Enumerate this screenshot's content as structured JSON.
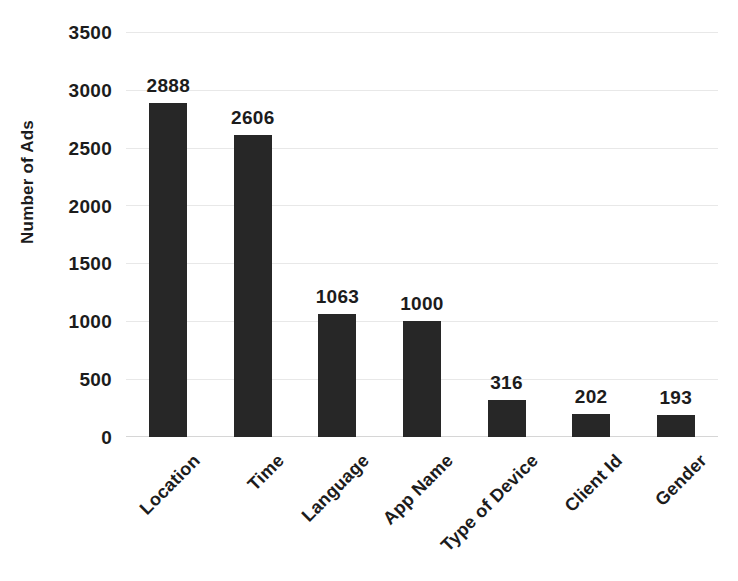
{
  "chart_data": {
    "type": "bar",
    "title": "",
    "subtitle": "",
    "xlabel": "",
    "ylabel": "Number of Ads",
    "categories": [
      "Location",
      "Time",
      "Language",
      "App Name",
      "Type of Device",
      "Client Id",
      "Gender"
    ],
    "values": [
      2888,
      2606,
      1063,
      1000,
      316,
      202,
      193
    ],
    "data_labels": [
      "2888",
      "2606",
      "1063",
      "1000",
      "316",
      "202",
      "193"
    ],
    "ylim": [
      0,
      3500
    ],
    "ytick_values": [
      3500,
      3000,
      2500,
      2000,
      1500,
      1000,
      500,
      0
    ],
    "ytick_labels": [
      "3500",
      "3000",
      "2500",
      "2000",
      "1500",
      "1000",
      "500",
      "0"
    ],
    "grid": "horizontal",
    "legend": "none",
    "bar_color": "#272727",
    "gridline_color": "#e8e8e8",
    "axis_text_color": "#1c1c1c",
    "background_color": "#ffffff",
    "xtick_label_rotation": "-45"
  }
}
